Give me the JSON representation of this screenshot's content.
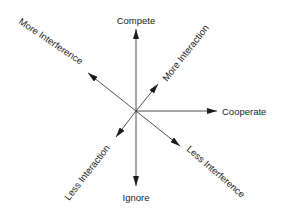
{
  "diagram": {
    "type": "radial-axes",
    "center": [
      136,
      111
    ],
    "colors": {
      "line": "#3a3a3a",
      "text": "#222222",
      "background": "#ffffff"
    },
    "axes": [
      {
        "id": "compete",
        "label": "Compete",
        "tip": [
          136,
          29
        ]
      },
      {
        "id": "ignore",
        "label": "Ignore",
        "tip": [
          136,
          186
        ]
      },
      {
        "id": "cooperate",
        "label": "Cooperate",
        "tip": [
          217,
          111
        ]
      },
      {
        "id": "more-interference",
        "label": "More Interference",
        "tip": [
          88,
          73
        ]
      },
      {
        "id": "more-interaction",
        "label": "More Interaction",
        "tip": [
          158,
          84
        ]
      },
      {
        "id": "less-interaction",
        "label": "Less Interaction",
        "tip": [
          116,
          137
        ]
      },
      {
        "id": "less-interference",
        "label": "Less Interference",
        "tip": [
          180,
          146
        ]
      }
    ]
  }
}
